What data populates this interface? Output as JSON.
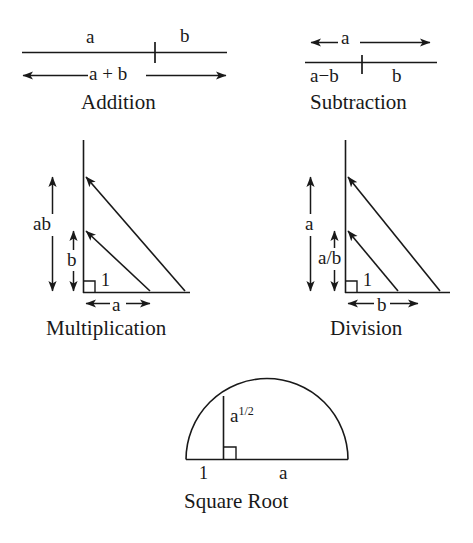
{
  "page": {
    "background_color": "#ffffff",
    "ink_color": "#191919",
    "width": 473,
    "height": 543
  },
  "figures": [
    {
      "id": "addition",
      "caption": "Addition",
      "labels": {
        "segment_left": "a",
        "segment_right": "b",
        "total": "a + b"
      }
    },
    {
      "id": "subtraction",
      "caption": "Subtraction",
      "labels": {
        "total": "a",
        "segment_left": "a−b",
        "segment_right": "b"
      }
    },
    {
      "id": "multiplication",
      "caption": "Multiplication",
      "labels": {
        "outer_height": "ab",
        "inner_height": "b",
        "unit": "1",
        "base": "a"
      }
    },
    {
      "id": "division",
      "caption": "Division",
      "labels": {
        "outer_height": "a",
        "inner_height": "a/b",
        "unit": "1",
        "base": "b"
      }
    },
    {
      "id": "square-root",
      "caption": "Square Root",
      "labels": {
        "altitude": "a",
        "altitude_exponent": "1/2",
        "base_left": "1",
        "base_right": "a"
      }
    }
  ]
}
